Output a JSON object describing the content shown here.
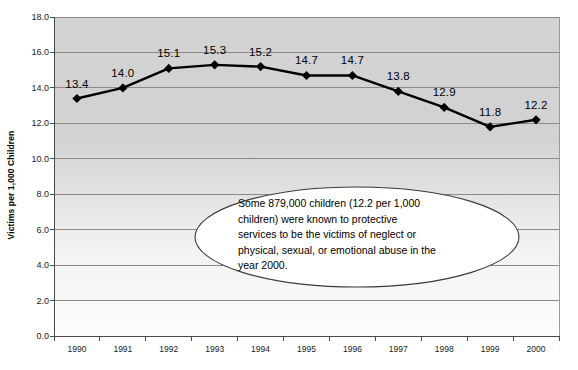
{
  "chart_data": {
    "type": "line",
    "title": "",
    "xlabel": "",
    "ylabel": "Victims per 1,000 Children",
    "categories": [
      "1990",
      "1991",
      "1992",
      "1993",
      "1994",
      "1995",
      "1996",
      "1997",
      "1998",
      "1999",
      "2000"
    ],
    "values": [
      13.4,
      14.0,
      15.1,
      15.3,
      15.2,
      14.7,
      14.7,
      13.8,
      12.9,
      11.8,
      12.2
    ],
    "data_labels": [
      "13.4",
      "14.0",
      "15.1",
      "15.3",
      "15.2",
      "14.7",
      "14.7",
      "13.8",
      "12.9",
      "11.8",
      "12.2"
    ],
    "ylim": [
      0.0,
      18.0
    ],
    "ytick_step": 2.0,
    "ytick_labels": [
      "18.0",
      "16.0",
      "14.0",
      "12.0",
      "10.0",
      "8.0",
      "6.0",
      "4.0",
      "2.0",
      "0.0"
    ],
    "ytick_values": [
      18.0,
      16.0,
      14.0,
      12.0,
      10.0,
      8.0,
      6.0,
      4.0,
      2.0,
      0.0
    ],
    "grid": true,
    "grid_axis": "y",
    "legend": false,
    "legend_position": "none",
    "series_name": "Victims per 1,000 Children",
    "marker": "diamond",
    "marker_color": "#000000",
    "line_color": "#000000",
    "plot_background_top": "#d4d4d4",
    "plot_background_bottom": "#ffffff",
    "grid_color": "#808080",
    "axis_color": "#555555"
  },
  "annotation": {
    "name": "callout-ellipse",
    "shape": "ellipse",
    "fill": "#ffffff",
    "stroke": "#3a3a3a",
    "lines": [
      "Some 879,000 children (12.2 per 1,000",
      "children) were known to protective",
      "services to be the victims of neglect or",
      "physical, sexual, or emotional abuse in the",
      "year 2000."
    ]
  }
}
